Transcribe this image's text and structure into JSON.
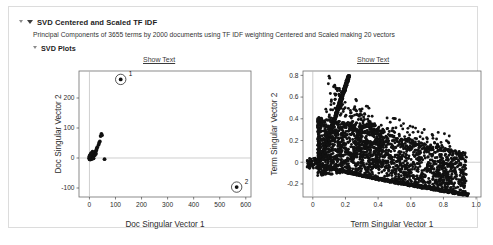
{
  "report": {
    "title": "SVD Centered and Scaled TF IDF",
    "description": "Principal Components of 3655 terms by 2000 documents using TF IDF weighting Centered and Scaled making 20 vectors",
    "section_title": "SVD Plots",
    "show_text_left": "Show Text",
    "show_text_right": "Show Text",
    "icons": {
      "outer_disclosure": "triangle-down-icon",
      "svd_disclosure": "triangle-down-icon",
      "plots_disclosure": "triangle-down-icon"
    },
    "colors": {
      "point": "#111111",
      "axis": "#4a4a4a",
      "frame": "#6e6e6e",
      "reference_line": "#b9b9b9",
      "panel_border": "#dcdcdc",
      "link": "#3a3a3a"
    }
  },
  "chart_data": [
    {
      "type": "scatter",
      "name": "doc-singular-vectors",
      "title": "",
      "xlabel": "Doc Singular Vector 1",
      "ylabel": "Doc Singular Vector 2",
      "xlim": [
        -40,
        620
      ],
      "ylim": [
        -130,
        290
      ],
      "xticks": [
        0,
        100,
        200,
        300,
        400,
        500,
        600
      ],
      "yticks": [
        -100,
        0,
        100,
        200
      ],
      "grid": false,
      "reference_lines": {
        "x": 0,
        "y": 0
      },
      "legend": "none",
      "annotations": [
        {
          "label": "1",
          "x": 120,
          "y": 262,
          "circled": true
        },
        {
          "label": "2",
          "x": 565,
          "y": -97,
          "circled": true
        }
      ],
      "points": [
        [
          120,
          262
        ],
        [
          565,
          -97
        ],
        [
          46,
          80
        ],
        [
          48,
          76
        ],
        [
          43,
          73
        ],
        [
          40,
          55
        ],
        [
          37,
          50
        ],
        [
          35,
          44
        ],
        [
          30,
          36
        ],
        [
          28,
          31
        ],
        [
          26,
          26
        ],
        [
          24,
          22
        ],
        [
          22,
          19
        ],
        [
          20,
          16
        ],
        [
          19,
          13
        ],
        [
          17,
          11
        ],
        [
          16,
          9
        ],
        [
          15,
          7
        ],
        [
          14,
          6
        ],
        [
          13,
          5
        ],
        [
          12,
          4
        ],
        [
          11,
          3
        ],
        [
          10,
          2
        ],
        [
          9,
          2
        ],
        [
          8,
          1
        ],
        [
          7,
          1
        ],
        [
          6,
          0
        ],
        [
          5,
          0
        ],
        [
          4,
          -1
        ],
        [
          3,
          -1
        ],
        [
          2,
          -2
        ],
        [
          1,
          -2
        ],
        [
          0,
          -3
        ],
        [
          58,
          -4
        ],
        [
          25,
          14
        ],
        [
          21,
          10
        ],
        [
          18,
          8
        ],
        [
          13,
          12
        ],
        [
          11,
          8
        ],
        [
          9,
          6
        ],
        [
          7,
          4
        ],
        [
          6,
          3
        ],
        [
          5,
          2
        ],
        [
          4,
          1
        ],
        [
          3,
          0
        ],
        [
          2,
          -1
        ],
        [
          8,
          14
        ],
        [
          10,
          18
        ],
        [
          12,
          21
        ],
        [
          6,
          7
        ],
        [
          5,
          5
        ],
        [
          4,
          3
        ],
        [
          3,
          2
        ],
        [
          2,
          1
        ],
        [
          1,
          0
        ],
        [
          0,
          -1
        ],
        [
          1,
          -3
        ],
        [
          2,
          -4
        ],
        [
          3,
          -5
        ],
        [
          5,
          -4
        ],
        [
          7,
          -3
        ],
        [
          9,
          -2
        ],
        [
          11,
          -2
        ],
        [
          14,
          -1
        ],
        [
          16,
          -1
        ],
        [
          2,
          6
        ],
        [
          3,
          9
        ],
        [
          4,
          12
        ],
        [
          6,
          15
        ],
        [
          1,
          4
        ],
        [
          0,
          2
        ],
        [
          0,
          5
        ],
        [
          1,
          7
        ]
      ]
    },
    {
      "type": "scatter",
      "name": "term-singular-vectors",
      "title": "",
      "xlabel": "Term Singular Vector 1",
      "ylabel": "Term Singular Vector 2",
      "xlim": [
        -0.06,
        1.03
      ],
      "ylim": [
        -0.32,
        0.84
      ],
      "xticks": [
        0,
        0.2,
        0.4,
        0.6,
        0.8,
        1.0
      ],
      "yticks": [
        -0.2,
        0,
        0.2,
        0.4,
        0.6,
        0.8
      ],
      "grid": false,
      "reference_lines": {
        "x": 0,
        "y": 0
      },
      "legend": "none",
      "n_points": 3655,
      "description": "Dense fan-shaped cloud of term loadings: a tight upper ridge rising from (0.05,0.0) to (0.22,0.79), a lower envelope descending from (0.05,-0.02) to (0.95,-0.30), and a broad scatter filling between, thinning toward x=1.0.",
      "annotations": []
    }
  ]
}
